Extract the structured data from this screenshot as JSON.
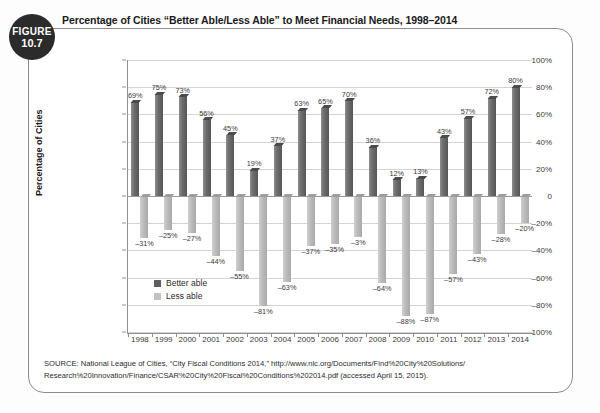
{
  "figure": {
    "badge_line1": "FIGURE",
    "badge_line2": "10.7"
  },
  "title": "Percentage of Cities “Better Able/Less Able” to Meet Financial Needs, 1998–2014",
  "source": {
    "line1": "SOURCE: National League of Cities, “City Fiscal Conditions 2014,” http://www.nlc.org/Documents/Find%20City%20Solutions/",
    "line2": "Research%20Innovation/Finance/CSAR%20City%20Fiscal%20Conditions%202014.pdf (accessed April 15, 2015)."
  },
  "colors": {
    "better_able": "#5d5d5d",
    "less_able": "#c2c2c2",
    "frame": "#8c8c8c",
    "badge": "#2b2b2b",
    "grid": "#d4d4d4"
  },
  "chart_data": {
    "type": "bar",
    "title": "Percentage of Cities “Better Able/Less Able” to Meet Financial Needs, 1998–2014",
    "xlabel": "",
    "ylabel": "Percentage of Cities",
    "ylim": [
      -100,
      100
    ],
    "ytick_step": 20,
    "ytick_labels": [
      "100%",
      "80%",
      "60%",
      "40%",
      "20%",
      "0",
      "–20%",
      "–40%",
      "–60%",
      "–80%",
      "–100%"
    ],
    "ytick_values": [
      100,
      80,
      60,
      40,
      20,
      0,
      -20,
      -40,
      -60,
      -80,
      -100
    ],
    "grid": true,
    "legend_position": "inside-left",
    "categories": [
      "1998",
      "1999",
      "2000",
      "2001",
      "2002",
      "2003",
      "2004",
      "2005",
      "2006",
      "2007",
      "2008",
      "2009",
      "2010",
      "2011",
      "2012",
      "2013",
      "2014"
    ],
    "series": [
      {
        "name": "Better able",
        "color": "#5d5d5d",
        "values": [
          69,
          75,
          73,
          56,
          45,
          19,
          37,
          63,
          65,
          70,
          36,
          12,
          13,
          43,
          57,
          72,
          80
        ],
        "labels": [
          "69%",
          "75%",
          "73%",
          "56%",
          "45%",
          "19%",
          "37%",
          "63%",
          "65%",
          "70%",
          "36%",
          "12%",
          "13%",
          "43%",
          "57%",
          "72%",
          "80%"
        ]
      },
      {
        "name": "Less able",
        "color": "#c2c2c2",
        "values": [
          -31,
          -25,
          -27,
          -44,
          -55,
          -81,
          -63,
          -37,
          -35,
          -30,
          -64,
          -88,
          -87,
          -57,
          -43,
          -28,
          -20
        ],
        "labels": [
          "–31%",
          "–25%",
          "–27%",
          "–44%",
          "–55%",
          "–81%",
          "–63%",
          "–37%",
          "–35%",
          "–3%",
          "–64%",
          "–88%",
          "–87%",
          "–57%",
          "–43%",
          "–28%",
          "–20%"
        ]
      }
    ]
  }
}
